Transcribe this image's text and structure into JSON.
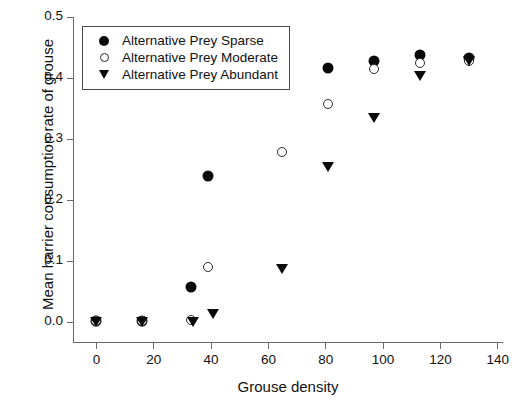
{
  "chart_data": {
    "type": "scatter",
    "title": "",
    "xlabel": "Grouse density",
    "ylabel": "Mean harrier consumption rate of grouse",
    "xlim": [
      -8,
      142
    ],
    "ylim": [
      -0.035,
      0.5
    ],
    "xticks": [
      0,
      20,
      40,
      60,
      80,
      100,
      120,
      140
    ],
    "xtick_labels": [
      "0",
      "20",
      "40",
      "60",
      "80",
      "100",
      "120",
      "140"
    ],
    "yticks": [
      0.0,
      0.1,
      0.2,
      0.3,
      0.4,
      0.5
    ],
    "ytick_labels": [
      "0.0",
      "0.1",
      "0.2",
      "0.3",
      "0.4",
      "0.5"
    ],
    "grid": false,
    "legend_position": "top-left",
    "marker_color": "#0a0a0a",
    "axis_color": "#666b6e",
    "series": [
      {
        "name": "Alternative Prey Sparse",
        "marker": "filled-circle",
        "points": [
          {
            "x": 0,
            "y": 0.001
          },
          {
            "x": 16,
            "y": 0.001
          },
          {
            "x": 33,
            "y": 0.057
          },
          {
            "x": 39,
            "y": 0.239
          },
          {
            "x": 65,
            "y": 0.396
          },
          {
            "x": 81,
            "y": 0.417
          },
          {
            "x": 97,
            "y": 0.428
          },
          {
            "x": 113,
            "y": 0.437
          },
          {
            "x": 130,
            "y": 0.433
          }
        ]
      },
      {
        "name": "Alternative Prey Moderate",
        "marker": "open-circle",
        "points": [
          {
            "x": 0,
            "y": 0.001
          },
          {
            "x": 16,
            "y": 0.001
          },
          {
            "x": 33,
            "y": 0.003
          },
          {
            "x": 39,
            "y": 0.089
          },
          {
            "x": 65,
            "y": 0.279
          },
          {
            "x": 81,
            "y": 0.357
          },
          {
            "x": 97,
            "y": 0.414
          },
          {
            "x": 113,
            "y": 0.424
          },
          {
            "x": 130,
            "y": 0.428
          }
        ]
      },
      {
        "name": "Alternative Prey Abundant",
        "marker": "triangle-down",
        "points": [
          {
            "x": 0,
            "y": 0.0
          },
          {
            "x": 16,
            "y": 0.0
          },
          {
            "x": 34,
            "y": 0.0
          },
          {
            "x": 41,
            "y": 0.012
          },
          {
            "x": 65,
            "y": 0.087
          },
          {
            "x": 81,
            "y": 0.254
          },
          {
            "x": 97,
            "y": 0.334
          },
          {
            "x": 113,
            "y": 0.403
          },
          {
            "x": 130,
            "y": 0.428
          }
        ]
      }
    ]
  },
  "legend": {
    "entries": [
      {
        "label": "Alternative Prey Sparse",
        "marker": "filled-circle"
      },
      {
        "label": "Alternative Prey Moderate",
        "marker": "open-circle"
      },
      {
        "label": "Alternative Prey Abundant",
        "marker": "triangle-down"
      }
    ]
  }
}
